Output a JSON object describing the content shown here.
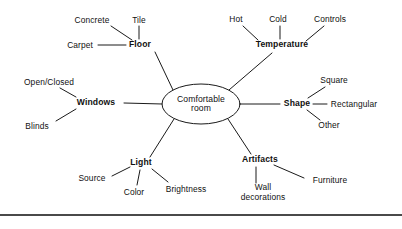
{
  "diagram": {
    "type": "mind-map",
    "center": {
      "label_line1": "Comfortable",
      "label_line2": "room",
      "cx": 201,
      "cy": 104,
      "rx": 39,
      "ry": 20
    },
    "bottom_rule_color": "#4a4a4a",
    "line_color": "#1a1a1a",
    "background": "#ffffff",
    "branches": [
      {
        "name": "floor",
        "label": "Floor",
        "x": 140,
        "y": 45,
        "leaves": [
          {
            "name": "concrete",
            "label": "Concrete",
            "x": 92,
            "y": 20
          },
          {
            "name": "tile",
            "label": "Tile",
            "x": 139,
            "y": 20
          },
          {
            "name": "carpet",
            "label": "Carpet",
            "x": 80,
            "y": 45
          }
        ]
      },
      {
        "name": "temperature",
        "label": "Temperature",
        "x": 282,
        "y": 45,
        "leaves": [
          {
            "name": "hot",
            "label": "Hot",
            "x": 236,
            "y": 19
          },
          {
            "name": "cold",
            "label": "Cold",
            "x": 278,
            "y": 19
          },
          {
            "name": "controls",
            "label": "Controls",
            "x": 330,
            "y": 19
          }
        ]
      },
      {
        "name": "windows",
        "label": "Windows",
        "x": 96,
        "y": 103,
        "leaves": [
          {
            "name": "open-closed",
            "label": "Open/Closed",
            "x": 49,
            "y": 82
          },
          {
            "name": "blinds",
            "label": "Blinds",
            "x": 37,
            "y": 126
          }
        ]
      },
      {
        "name": "shape",
        "label": "Shape",
        "x": 297,
        "y": 104,
        "leaves": [
          {
            "name": "square",
            "label": "Square",
            "x": 334,
            "y": 80
          },
          {
            "name": "rectangular",
            "label": "Rectangular",
            "x": 354,
            "y": 104
          },
          {
            "name": "other",
            "label": "Other",
            "x": 329,
            "y": 125
          }
        ]
      },
      {
        "name": "light",
        "label": "Light",
        "x": 141,
        "y": 163,
        "leaves": [
          {
            "name": "source",
            "label": "Source",
            "x": 92,
            "y": 178
          },
          {
            "name": "color",
            "label": "Color",
            "x": 134,
            "y": 192
          },
          {
            "name": "brightness",
            "label": "Brightness",
            "x": 186,
            "y": 189
          }
        ]
      },
      {
        "name": "artifacts",
        "label": "Artifacts",
        "x": 260,
        "y": 160,
        "leaves": [
          {
            "name": "furniture",
            "label": "Furniture",
            "x": 330,
            "y": 180
          },
          {
            "name": "wall-decorations",
            "label_line1": "Wall",
            "label_line2": "decorations",
            "x": 263,
            "y": 192
          }
        ]
      }
    ]
  }
}
